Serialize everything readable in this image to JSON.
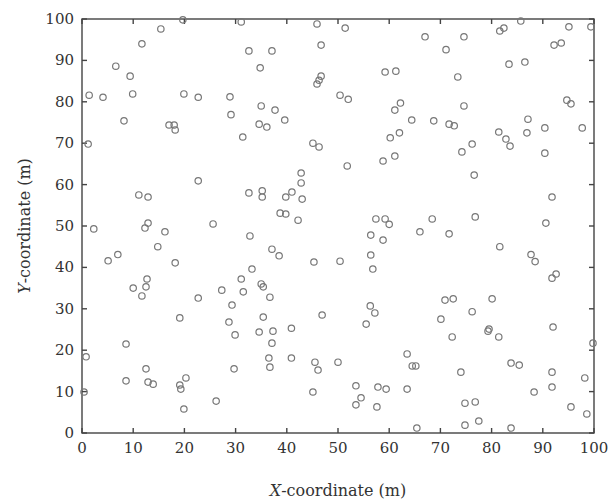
{
  "chart_data": {
    "type": "scatter",
    "title": "",
    "xlabel": "X-coordinate (m)",
    "xlabel_var": "X",
    "xlabel_rest": "-coordinate (m)",
    "ylabel": "Y-coordinate (m)",
    "ylabel_var": "Y",
    "ylabel_rest": "-coordinate (m)",
    "xlim": [
      0,
      100
    ],
    "ylim": [
      0,
      100
    ],
    "xticks": [
      0,
      10,
      20,
      30,
      40,
      50,
      60,
      70,
      80,
      90,
      100
    ],
    "yticks": [
      0,
      10,
      20,
      30,
      40,
      50,
      60,
      70,
      80,
      90,
      100
    ],
    "grid": false,
    "legend": null,
    "marker": "open-circle",
    "marker_color": "#777777",
    "series": [
      {
        "name": "points",
        "x": [
          1.4,
          4.1,
          6.6,
          9.4,
          9.9,
          11.7,
          15.4,
          19.7,
          19.9,
          22.7,
          8.2,
          31.1,
          32.6,
          37.1,
          34.8,
          45.9,
          46.7,
          46.7,
          46.3,
          45.9,
          50.4,
          28.9,
          29.1,
          35.0,
          37.7,
          39.6,
          34.6,
          36.1,
          51.4,
          59.2,
          61.3,
          67.0,
          71.1,
          74.6,
          73.4,
          52.0,
          62.2,
          61.1,
          74.6,
          64.4,
          68.7,
          71.7,
          72.7,
          81.6,
          82.4,
          85.7,
          95.1,
          99.4,
          92.2,
          93.6,
          83.4,
          86.5,
          94.7,
          95.5,
          87.1,
          17.0,
          18.0,
          18.2,
          1.2,
          22.7,
          11.1,
          12.9,
          12.9,
          12.3,
          2.3,
          25.6,
          31.4,
          45.1,
          46.3,
          42.8,
          42.8,
          32.6,
          35.2,
          35.2,
          39.8,
          41.0,
          43.0,
          38.7,
          39.8,
          42.2,
          60.2,
          62.0,
          51.8,
          58.8,
          61.1,
          74.2,
          76.2,
          81.4,
          82.8,
          83.6,
          86.9,
          90.4,
          97.7,
          90.4,
          76.6,
          91.8,
          57.4,
          59.2,
          60.0,
          68.4,
          76.8,
          90.6,
          16.2,
          14.8,
          5.1,
          7.0,
          18.2,
          12.7,
          12.5,
          10.0,
          11.7,
          22.7,
          19.1,
          32.8,
          37.1,
          38.5,
          45.3,
          50.4,
          33.2,
          31.1,
          35.0,
          35.4,
          27.3,
          31.5,
          36.7,
          29.3,
          35.4,
          46.9,
          28.7,
          56.4,
          58.8,
          66.0,
          71.7,
          56.4,
          56.8,
          70.9,
          72.5,
          56.3,
          57.2,
          70.1,
          55.5,
          76.2,
          81.6,
          87.7,
          88.5,
          91.8,
          92.6,
          80.1,
          79.5,
          92.0,
          0.8,
          0.4,
          8.6,
          8.6,
          12.5,
          12.9,
          13.9,
          19.1,
          19.3,
          20.3,
          19.9,
          26.2,
          29.7,
          34.6,
          37.3,
          37.1,
          36.7,
          40.9,
          40.9,
          45.5,
          46.1,
          45.1,
          50.0,
          29.9,
          36.5,
          53.5,
          54.5,
          53.5,
          57.8,
          57.6,
          59.4,
          63.5,
          64.5,
          65.2,
          63.5,
          65.4,
          72.3,
          74.0,
          74.8,
          74.8,
          76.8,
          77.5,
          79.3,
          83.8,
          85.4,
          88.3,
          91.8,
          91.8,
          95.5,
          98.2,
          98.6,
          99.8,
          83.8,
          81.4
        ],
        "y": [
          81.6,
          81.1,
          88.6,
          86.2,
          81.9,
          94.0,
          97.6,
          99.8,
          81.9,
          81.1,
          75.4,
          99.3,
          92.3,
          92.3,
          88.2,
          98.8,
          93.7,
          86.2,
          85.2,
          84.3,
          81.6,
          81.2,
          76.9,
          79.0,
          78.0,
          75.6,
          74.6,
          73.9,
          97.8,
          87.2,
          87.4,
          95.7,
          92.6,
          95.7,
          86.0,
          80.6,
          79.7,
          78.0,
          79.0,
          75.6,
          75.4,
          74.6,
          74.2,
          97.1,
          97.8,
          99.5,
          98.1,
          98.1,
          93.7,
          94.2,
          89.1,
          89.6,
          80.4,
          79.5,
          75.8,
          74.4,
          74.4,
          73.2,
          69.8,
          60.9,
          57.5,
          57.0,
          50.7,
          49.5,
          49.3,
          50.5,
          71.5,
          70.0,
          69.1,
          62.8,
          60.4,
          58.0,
          58.5,
          57.0,
          57.0,
          58.2,
          56.5,
          53.1,
          52.9,
          51.4,
          71.3,
          72.5,
          64.5,
          65.7,
          66.9,
          67.9,
          69.8,
          72.7,
          71.0,
          69.3,
          72.5,
          73.7,
          73.7,
          67.6,
          62.3,
          57.0,
          51.7,
          51.7,
          50.4,
          51.7,
          52.2,
          50.7,
          48.6,
          45.0,
          41.6,
          43.1,
          41.1,
          37.2,
          35.3,
          35.0,
          33.1,
          32.6,
          27.8,
          47.6,
          44.4,
          42.8,
          41.3,
          41.5,
          39.6,
          37.2,
          36.0,
          35.3,
          34.5,
          34.1,
          32.8,
          30.9,
          28.0,
          28.5,
          26.8,
          47.8,
          46.6,
          48.6,
          48.1,
          43.0,
          39.6,
          32.1,
          32.4,
          30.7,
          29.0,
          27.5,
          26.3,
          29.3,
          45.0,
          43.1,
          41.4,
          37.4,
          38.4,
          32.4,
          25.1,
          25.6,
          18.4,
          9.9,
          21.5,
          12.6,
          15.5,
          12.3,
          11.8,
          11.6,
          10.6,
          13.3,
          5.8,
          7.7,
          15.5,
          24.4,
          24.6,
          21.7,
          15.9,
          18.1,
          25.3,
          17.1,
          15.2,
          9.9,
          17.1,
          23.7,
          18.1,
          11.4,
          8.5,
          6.8,
          11.1,
          6.3,
          10.6,
          19.1,
          16.2,
          16.2,
          10.6,
          1.2,
          23.2,
          14.7,
          7.2,
          1.9,
          7.5,
          2.9,
          24.6,
          16.9,
          16.4,
          9.9,
          14.7,
          11.1,
          6.3,
          13.3,
          4.6,
          21.7,
          1.2,
          23.2
        ]
      }
    ]
  }
}
